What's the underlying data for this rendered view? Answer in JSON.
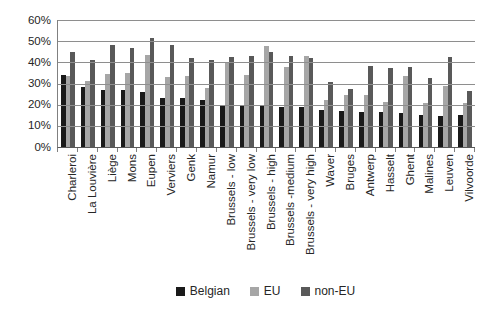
{
  "chart_data": {
    "type": "bar",
    "title": "",
    "xlabel": "",
    "ylabel": "",
    "ylim": [
      0,
      60
    ],
    "grid": "horizontal",
    "legend_position": "bottom",
    "y_ticks": [
      {
        "value": 0,
        "label": "0%"
      },
      {
        "value": 10,
        "label": "10%"
      },
      {
        "value": 20,
        "label": "20%"
      },
      {
        "value": 30,
        "label": "30%"
      },
      {
        "value": 40,
        "label": "40%"
      },
      {
        "value": 50,
        "label": "50%"
      },
      {
        "value": 60,
        "label": "60%"
      }
    ],
    "categories": [
      "Charleroi",
      "La Louvière",
      "Liège",
      "Mons",
      "Eupen",
      "Verviers",
      "Genk",
      "Namur",
      "Brussels - low",
      "Brussels - very low",
      "Brussels - high",
      "Brussels -medium",
      "Brussels - very high",
      "Waver",
      "Bruges",
      "Antwerp",
      "Hasselt",
      "Ghent",
      "Malines",
      "Leuven",
      "Vilvoorde"
    ],
    "series": [
      {
        "name": "Belgian",
        "color": "#1a1a1a",
        "values": [
          34,
          28.5,
          27,
          27,
          26,
          23,
          23,
          22,
          20,
          19.5,
          20,
          19,
          19,
          17.5,
          17,
          16.5,
          16.5,
          16,
          15,
          14.5,
          15
        ]
      },
      {
        "name": "EU",
        "color": "#a6a6a6",
        "values": [
          33.5,
          31,
          34.5,
          35,
          43.5,
          33,
          33.5,
          28,
          40,
          34,
          47.5,
          38,
          43,
          22,
          24.5,
          24.5,
          21.5,
          33.5,
          21,
          29,
          21
        ]
      },
      {
        "name": "non-EU",
        "color": "#595959",
        "values": [
          45,
          41,
          48,
          47,
          51.5,
          48,
          42,
          41,
          42.5,
          43,
          45,
          43,
          42,
          30.5,
          27.5,
          38.5,
          37.5,
          38,
          32.5,
          42.5,
          26.5
        ]
      }
    ]
  },
  "colors": {
    "background": "#ffffff",
    "gridline": "#8e8e8e",
    "axis_line": "#595959",
    "text": "#262626"
  }
}
